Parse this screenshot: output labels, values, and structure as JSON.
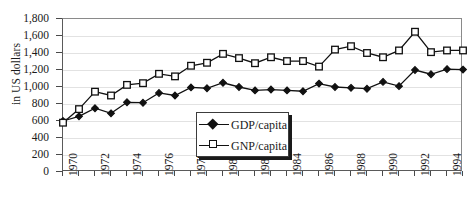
{
  "chart_data": {
    "type": "line",
    "title": "",
    "xlabel": "",
    "ylabel": "in US dollars",
    "ylim": [
      0,
      1800
    ],
    "xlim": [
      1970,
      1995
    ],
    "grid": true,
    "legend_position": "inside-bottom-center",
    "y_ticks": [
      "0",
      "200",
      "400",
      "600",
      "800",
      "1,000",
      "1,200",
      "1,400",
      "1,600",
      "1,800"
    ],
    "y_tick_values": [
      0,
      200,
      400,
      600,
      800,
      1000,
      1200,
      1400,
      1600,
      1800
    ],
    "x": [
      1970,
      1971,
      1972,
      1973,
      1974,
      1975,
      1976,
      1977,
      1978,
      1979,
      1980,
      1981,
      1982,
      1983,
      1984,
      1985,
      1986,
      1987,
      1988,
      1989,
      1990,
      1991,
      1992,
      1993,
      1994,
      1995
    ],
    "x_tick_labels": [
      "1970",
      "1972",
      "1974",
      "1976",
      "1978",
      "1980",
      "1982",
      "1984",
      "1986",
      "1988",
      "1990",
      "1992",
      "1994"
    ],
    "x_tick_label_values": [
      1970,
      1972,
      1974,
      1976,
      1978,
      1980,
      1982,
      1984,
      1986,
      1988,
      1990,
      1992,
      1994
    ],
    "series": [
      {
        "name": "GDP/capita",
        "marker": "filled-diamond",
        "color": "#111111",
        "values": [
          600,
          655,
          750,
          690,
          820,
          815,
          930,
          900,
          995,
          985,
          1050,
          1000,
          960,
          970,
          960,
          950,
          1040,
          1000,
          990,
          980,
          1060,
          1010,
          1200,
          1150,
          1210,
          1205
        ]
      },
      {
        "name": "GNP/capita",
        "marker": "open-square",
        "color": "#111111",
        "values": [
          580,
          740,
          945,
          900,
          1025,
          1045,
          1155,
          1125,
          1250,
          1285,
          1390,
          1340,
          1280,
          1350,
          1305,
          1305,
          1240,
          1440,
          1480,
          1400,
          1350,
          1430,
          1650,
          1410,
          1430,
          1430
        ]
      }
    ]
  },
  "legend": {
    "entries": [
      {
        "label": "GDP/capita",
        "marker": "filled-diamond"
      },
      {
        "label": "GNP/capita",
        "marker": "open-square"
      }
    ]
  }
}
